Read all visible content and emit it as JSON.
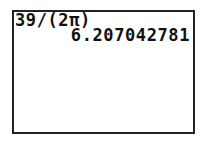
{
  "calculator": {
    "screen": {
      "history": [
        {
          "expression": "39/(2π)",
          "result": "6.207042781"
        }
      ]
    }
  }
}
